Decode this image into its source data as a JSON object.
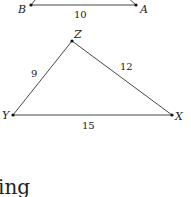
{
  "figure_top": {
    "vertices": [
      {
        "name": "B",
        "x": 31,
        "y": 5
      },
      {
        "name": "A",
        "x": 136,
        "y": 5
      }
    ],
    "side_label_BA": "10"
  },
  "figure_bottom": {
    "vertices": [
      {
        "name": "Z",
        "x": 72,
        "y": 41
      },
      {
        "name": "Y",
        "x": 13,
        "y": 115
      },
      {
        "name": "X",
        "x": 172,
        "y": 115
      }
    ],
    "side_label_ZY": "9",
    "side_label_ZX": "12",
    "side_label_YX": "15"
  },
  "labels": {
    "B": "B",
    "A": "A",
    "Z": "Z",
    "Y": "Y",
    "X": "X"
  },
  "body_text_fragment": "ing"
}
